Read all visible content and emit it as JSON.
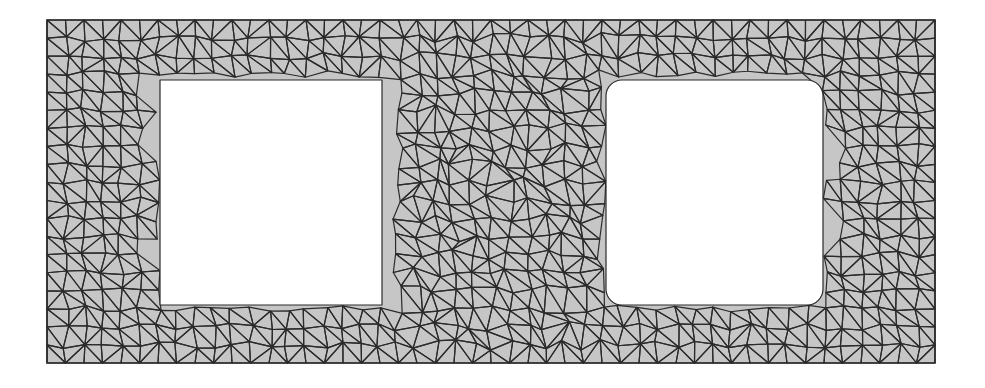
{
  "figure": {
    "type": "triangular-mesh",
    "background": "#ffffff",
    "fill_color": "#c6c6c6",
    "edge_color": "#2b2b2b",
    "edge_width": 1.2,
    "outer_boundary": {
      "x0": 47,
      "y0": 20,
      "x1": 935,
      "y1": 363
    },
    "holes": [
      {
        "name": "left-hole",
        "x0": 160,
        "y0": 80,
        "x1": 382,
        "y1": 305,
        "corner_radius": 0
      },
      {
        "name": "right-hole",
        "x0": 606,
        "y0": 80,
        "x1": 823,
        "y1": 305,
        "corner_radius": 16
      }
    ],
    "grid_spacing": 18.5,
    "jitter": 3.5
  }
}
